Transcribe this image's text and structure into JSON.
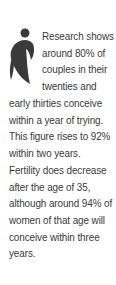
{
  "callout": {
    "icon": "person-figure-icon",
    "color": "#3a3a3a",
    "lines": [
      "Research shows",
      "around 80% of",
      "couples in their",
      "twenties and",
      "early thirties conceive",
      "within a year of trying.",
      "This figure rises to 92%",
      "within two years.",
      "Fertility does decrease",
      "after the age of 35,",
      "although around 94% of",
      "women of that age will",
      "conceive within three",
      "years."
    ]
  }
}
